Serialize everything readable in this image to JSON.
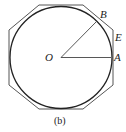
{
  "figure": {
    "caption": "(b)",
    "labels": {
      "center": "O",
      "point_a": "A",
      "point_b": "B",
      "point_e": "E"
    },
    "shapes": {
      "circle": "inscribed circle centered at O",
      "polygon": "circumscribed regular octagon"
    },
    "colors": {
      "stroke": "#333333",
      "polygon_stroke": "#555555"
    }
  }
}
